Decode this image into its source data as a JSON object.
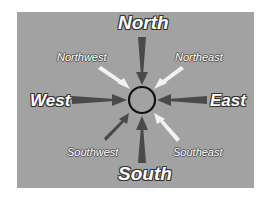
{
  "diagram": {
    "center": {
      "shape": "circle",
      "color": "#111111"
    },
    "background_color": "#a2a2a2",
    "directions": {
      "north": {
        "label": "North",
        "arrow_color": "#4a4a4a"
      },
      "south": {
        "label": "South",
        "arrow_color": "#4a4a4a"
      },
      "east": {
        "label": "East",
        "arrow_color": "#4a4a4a"
      },
      "west": {
        "label": "West",
        "arrow_color": "#4a4a4a"
      },
      "northwest": {
        "label": "Northwest",
        "arrow_color": "#f2f2f2"
      },
      "northeast": {
        "label": "Northeast",
        "arrow_color": "#f2f2f2"
      },
      "southwest": {
        "label": "Southwest",
        "arrow_color": "#4a4a4a"
      },
      "southeast": {
        "label": "Southeast",
        "arrow_color": "#f2f2f2"
      }
    }
  }
}
